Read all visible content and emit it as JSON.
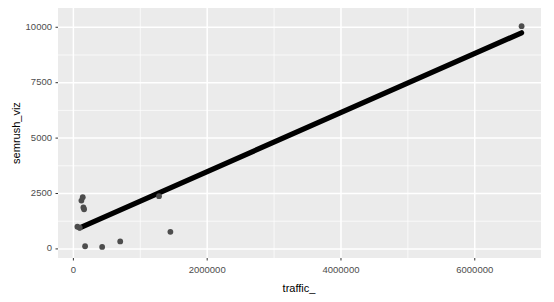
{
  "chart_data": {
    "type": "scatter",
    "title": "",
    "subtitle": "",
    "xlabel": "traffic_",
    "ylabel": "semrush_viz",
    "xlim": [
      -230000,
      6990000
    ],
    "ylim": [
      -410,
      10870
    ],
    "grid": true,
    "legend": "none",
    "panel_background": "#ebebeb",
    "grid_color": "#ffffff",
    "point_color": "#4d4d4d",
    "line_color": "#000000",
    "xticks": [
      0,
      2000000,
      4000000,
      6000000
    ],
    "xtick_labels": [
      "0",
      "2000000",
      "4000000",
      "6000000"
    ],
    "yticks": [
      0,
      2500,
      5000,
      7500,
      10000
    ],
    "ytick_labels": [
      "0",
      "2500",
      "5000",
      "7500",
      "10000"
    ],
    "x": [
      60000,
      95000,
      120000,
      140000,
      150000,
      160000,
      175000,
      430000,
      700000,
      1280000,
      1450000,
      1650000,
      6700000
    ],
    "y": [
      1000,
      960,
      2180,
      2330,
      1870,
      1790,
      120,
      90,
      340,
      2380,
      770,
      2330,
      10050
    ],
    "series": [
      {
        "name": "observations",
        "type": "scatter",
        "points": [
          {
            "x": 60000,
            "y": 1000
          },
          {
            "x": 95000,
            "y": 960
          },
          {
            "x": 120000,
            "y": 2180
          },
          {
            "x": 140000,
            "y": 2330
          },
          {
            "x": 150000,
            "y": 1870
          },
          {
            "x": 160000,
            "y": 1790
          },
          {
            "x": 175000,
            "y": 120
          },
          {
            "x": 430000,
            "y": 90
          },
          {
            "x": 700000,
            "y": 340
          },
          {
            "x": 1280000,
            "y": 2380
          },
          {
            "x": 1450000,
            "y": 770
          },
          {
            "x": 6700000,
            "y": 10050
          }
        ]
      },
      {
        "name": "trend-line",
        "type": "line",
        "points": [
          {
            "x": 95000,
            "y": 950
          },
          {
            "x": 6700000,
            "y": 9750
          }
        ]
      }
    ]
  },
  "axes": {
    "y_title": "semrush_viz",
    "x_title": "traffic_"
  }
}
